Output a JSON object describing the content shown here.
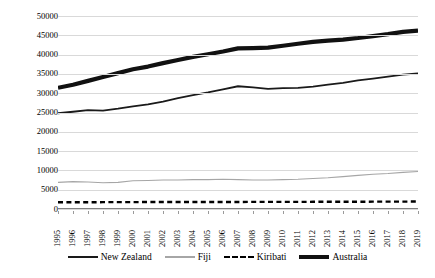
{
  "chart_data": {
    "type": "line",
    "title": "",
    "subtitle": "",
    "xlabel": "",
    "ylabel": "",
    "ylim": [
      0,
      50000
    ],
    "ytick_step": 5000,
    "grid": true,
    "legend_position": "bottom",
    "categories": [
      "1995",
      "1996",
      "1997",
      "1998",
      "1999",
      "2000",
      "2001",
      "2002",
      "2003",
      "2004",
      "2005",
      "2006",
      "2007",
      "2008",
      "2009",
      "2010",
      "2011",
      "2012",
      "2013",
      "2014",
      "2015",
      "2016",
      "2017",
      "2018",
      "2019"
    ],
    "ytick_labels": [
      "50000",
      "45000",
      "40000",
      "35000",
      "30000",
      "25000",
      "20000",
      "15000",
      "10000",
      "5000",
      "0"
    ],
    "ytick_values": [
      50000,
      45000,
      40000,
      35000,
      30000,
      25000,
      20000,
      15000,
      10000,
      5000,
      0
    ],
    "series": [
      {
        "name": "New Zealand",
        "style": "solid-medium-black",
        "color": "#1a1a1a",
        "width": 1.8,
        "values": [
          24800,
          25200,
          25600,
          25500,
          26000,
          26600,
          27100,
          27800,
          28700,
          29500,
          30200,
          31000,
          31800,
          31500,
          31100,
          31300,
          31400,
          31700,
          32200,
          32700,
          33300,
          33800,
          34300,
          34800,
          35100
        ]
      },
      {
        "name": "Fiji",
        "style": "solid-thin-gray",
        "color": "#a6a6a6",
        "width": 1.1,
        "values": [
          6900,
          7100,
          7000,
          6800,
          6900,
          7300,
          7400,
          7500,
          7500,
          7600,
          7600,
          7700,
          7600,
          7500,
          7500,
          7600,
          7700,
          7900,
          8100,
          8400,
          8700,
          9000,
          9200,
          9500,
          9700
        ]
      },
      {
        "name": "Kiribati",
        "style": "dashed-black",
        "color": "#000000",
        "width": 2.4,
        "values": [
          1750,
          1750,
          1760,
          1770,
          1780,
          1790,
          1800,
          1800,
          1810,
          1820,
          1820,
          1830,
          1830,
          1840,
          1840,
          1850,
          1850,
          1860,
          1870,
          1880,
          1890,
          1900,
          1910,
          1920,
          1930
        ]
      },
      {
        "name": "Australia",
        "style": "solid-thick-black",
        "color": "#111111",
        "width": 4.2,
        "values": [
          31400,
          32200,
          33200,
          34200,
          35200,
          36200,
          36900,
          37800,
          38600,
          39400,
          40100,
          40800,
          41600,
          41700,
          41800,
          42300,
          42800,
          43300,
          43600,
          43900,
          44300,
          44800,
          45300,
          45900,
          46200
        ]
      }
    ]
  },
  "legend": {
    "items": [
      {
        "label": "New Zealand",
        "swatch": "line-solid-medium-icon"
      },
      {
        "label": "Fiji",
        "swatch": "line-solid-thin-icon"
      },
      {
        "label": "Kiribati",
        "swatch": "line-dashed-icon"
      },
      {
        "label": "Australia",
        "swatch": "line-solid-thick-icon"
      }
    ]
  }
}
